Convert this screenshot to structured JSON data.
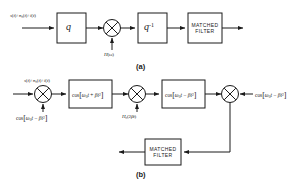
{
  "figure": {
    "title_note": "Block diagrams of chirp-transform / SAW convolver receivers",
    "captions": {
      "a": "(a)",
      "b": "(b)"
    }
  },
  "diagram_a": {
    "name": "transform-domain-processor",
    "input_label": "s(t)+n_c(t)+i(t)",
    "blocks": [
      {
        "id": "q-forward",
        "label": "q",
        "type": "transform"
      },
      {
        "id": "inverse-transform",
        "label": "q",
        "exponent": "-1",
        "type": "transform"
      },
      {
        "id": "matched-filter",
        "line1": "MATCHED",
        "line2": "FILTER",
        "type": "filter"
      }
    ],
    "multiplier": {
      "id": "mixer-a",
      "symbol": "X"
    },
    "weighting_label": "H(ω)",
    "output_label": ""
  },
  "diagram_b": {
    "name": "chirp-transform-receiver",
    "input_label": "s(t)+n_c(t)+i(t)",
    "mixers": [
      {
        "id": "mixer-b1",
        "symbol": "X"
      },
      {
        "id": "mixer-b2",
        "symbol": "X"
      },
      {
        "id": "mixer-b3",
        "symbol": "X"
      }
    ],
    "lo_bottom_left": "cos[ω₀t − βt²]",
    "chirp_filter_1": "cos[ω₀t + βt²]",
    "weighting_label": "H_c(2βt)",
    "chirp_filter_2": "cos[ω₀t − βt²]",
    "lo_right": "cos[ω₀t − βt²]",
    "matched_filter": {
      "line1": "MATCHED",
      "line2": "FILTER"
    }
  },
  "colors": {
    "line": "#1a1a1a",
    "background": "#ffffff",
    "text": "#1a1a1a"
  }
}
